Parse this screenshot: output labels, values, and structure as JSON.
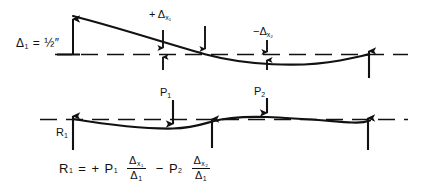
{
  "diagram": {
    "stroke_color": "#111111",
    "background": "#ffffff",
    "upper_panel": {
      "name": "deflected-shape-panel",
      "baseline_style": "dashed",
      "deflection_label": "Δ",
      "deflection_subscript": "1",
      "deflection_equals": "=",
      "deflection_value": "½″",
      "offset_positive": {
        "symbol": "+ Δ",
        "subscript": "x₁",
        "sign": "+",
        "station": "x1"
      },
      "offset_negative": {
        "symbol": "−Δ",
        "subscript": "x₂",
        "sign": "−",
        "station": "x2"
      }
    },
    "lower_panel": {
      "name": "loaded-beam-panel",
      "baseline_style": "dashed",
      "loads": [
        {
          "label": "P",
          "subscript": "1",
          "direction": "down",
          "x": 173
        },
        {
          "label": "P",
          "subscript": "2",
          "direction": "down",
          "x": 267
        }
      ],
      "reactions": [
        {
          "label": "R",
          "subscript": "1",
          "direction": "up",
          "x": 73
        },
        {
          "label": "",
          "subscript": "",
          "direction": "up",
          "x": 212
        },
        {
          "label": "",
          "subscript": "",
          "direction": "up",
          "x": 368
        }
      ]
    },
    "formula": {
      "name": "reaction-equation",
      "lhs": "R",
      "lhs_sub": "1",
      "equals": "=",
      "term1_sign": "+",
      "term1_coef": "P",
      "term1_coef_sub": "1",
      "term1_num": "Δ",
      "term1_num_sub": "x₁",
      "term1_den": "Δ",
      "term1_den_sub": "1",
      "term2_sign": "−",
      "term2_coef": "P",
      "term2_coef_sub": "2",
      "term2_num": "Δ",
      "term2_num_sub": "x₂",
      "term2_den": "Δ",
      "term2_den_sub": "1",
      "plain_text": "R₁ = + P₁ (Δx₁/Δ₁) − P₂ (Δx₂/Δ₁)"
    }
  }
}
